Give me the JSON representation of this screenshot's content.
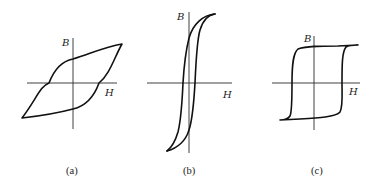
{
  "figure": {
    "panels": [
      {
        "id": "a",
        "caption": "(a)",
        "y_axis_label": "B",
        "x_axis_label": "H",
        "description": "Broad hysteresis loop with gradual slopes"
      },
      {
        "id": "b",
        "caption": "(b)",
        "y_axis_label": "B",
        "x_axis_label": "H",
        "description": "Narrow, tall hysteresis loop (soft magnetic material)"
      },
      {
        "id": "c",
        "caption": "(c)",
        "y_axis_label": "B",
        "x_axis_label": "H",
        "description": "Square hysteresis loop"
      }
    ],
    "colors": {
      "line": "#111111",
      "axis": "#2a2a2a",
      "background": "#ffffff"
    }
  }
}
